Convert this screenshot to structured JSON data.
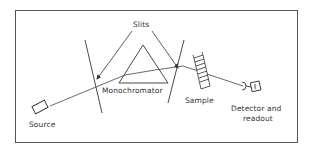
{
  "diagram": {
    "labels": {
      "slits": "Slits",
      "monochromator": "Monochromator",
      "source": "Source",
      "sample": "Sample",
      "detector_line1": "Detector and",
      "detector_line2": "readout"
    },
    "colors": {
      "line": "#333333",
      "border": "#555555",
      "background": "#ffffff"
    },
    "components": [
      "Source",
      "Slit",
      "Monochromator (prism)",
      "Slit",
      "Sample",
      "Detector and readout"
    ]
  }
}
